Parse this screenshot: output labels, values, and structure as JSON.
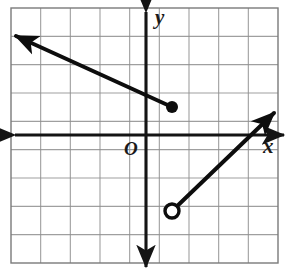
{
  "figure": {
    "name": "coordinate-plane-piecewise-graph",
    "width": 292,
    "height": 280,
    "background_color": "#ffffff"
  },
  "labels": {
    "y_axis": "y",
    "x_axis": "x",
    "origin": "O"
  },
  "colors": {
    "grid": "#8f8f8f",
    "grid_border": "#7a7a7a",
    "axis": "#141414",
    "curve": "#0d0d0d",
    "label": "#1a1a1a",
    "open_point_fill": "#ffffff"
  },
  "chart_data": {
    "type": "line",
    "title": "",
    "xlabel": "x",
    "ylabel": "y",
    "grid": true,
    "legend": null,
    "axis_arrows": [
      "left",
      "right",
      "up",
      "down"
    ],
    "origin_label": "O",
    "grid_columns": 9,
    "grid_rows": 9,
    "xlim": [
      -4.5,
      4.5
    ],
    "ylim": [
      -4.5,
      4.5
    ],
    "grid_step": 1,
    "origin_px": [
      146,
      135
    ],
    "px_per_unit_x": 29.7,
    "px_per_unit_y": 28.3,
    "grid_bounds_px": {
      "left": 11,
      "top": 8,
      "right": 278,
      "bottom": 263
    },
    "series": [
      {
        "name": "upper-ray",
        "style": "solid",
        "stroke_width": 4,
        "start_px": [
          172,
          107
        ],
        "end_px": [
          16,
          36
        ],
        "arrow_at": "end",
        "endpoint_marker": "closed-dot",
        "endpoint_px": [
          172,
          107
        ],
        "endpoint_xy": [
          0.9,
          1.0
        ],
        "arrow_tip_xy": [
          -4.4,
          3.5
        ],
        "slope_approx": -0.45
      },
      {
        "name": "lower-ray",
        "style": "solid",
        "stroke_width": 4,
        "start_px": [
          172,
          211
        ],
        "end_px": [
          274,
          113
        ],
        "arrow_at": "end",
        "endpoint_marker": "open-circle",
        "endpoint_px": [
          172,
          211
        ],
        "endpoint_xy": [
          0.9,
          -2.7
        ],
        "arrow_tip_xy": [
          4.3,
          0.8
        ],
        "slope_approx": 0.96
      }
    ],
    "markers": [
      {
        "kind": "closed-dot",
        "px": [
          172,
          107
        ],
        "radius_px": 6
      },
      {
        "kind": "open-circle",
        "px": [
          172,
          211
        ],
        "radius_px": 7
      }
    ]
  }
}
